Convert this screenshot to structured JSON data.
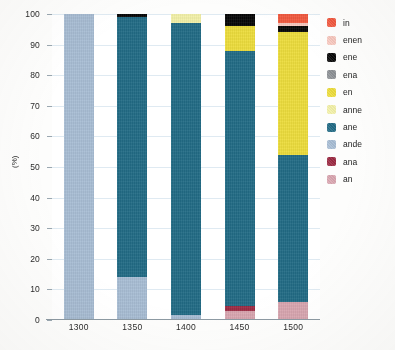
{
  "chart_data": {
    "type": "bar",
    "stacked": true,
    "title": "",
    "xlabel": "",
    "ylabel": "(%)",
    "ylim": [
      0,
      100
    ],
    "yticks": [
      0,
      10,
      20,
      30,
      40,
      50,
      60,
      70,
      80,
      90,
      100
    ],
    "grid": true,
    "legend_position": "right",
    "categories": [
      "1300",
      "1350",
      "1400",
      "1450",
      "1500"
    ],
    "series": [
      {
        "name": "an",
        "color": "#d9a6b0",
        "values": [
          0,
          0,
          0,
          3.0,
          6.0
        ]
      },
      {
        "name": "ana",
        "color": "#9c2b43",
        "values": [
          0,
          0,
          0,
          1.5,
          0
        ]
      },
      {
        "name": "ande",
        "color": "#a8bdd4",
        "values": [
          100,
          14.0,
          1.5,
          0,
          0
        ]
      },
      {
        "name": "ane",
        "color": "#226b85",
        "values": [
          0,
          85.0,
          95.5,
          83.5,
          48.0
        ]
      },
      {
        "name": "anne",
        "color": "#f2f0a8",
        "values": [
          0,
          0,
          3.0,
          0,
          0
        ]
      },
      {
        "name": "en",
        "color": "#ecdc3c",
        "values": [
          0,
          0,
          0,
          8.0,
          40.0
        ]
      },
      {
        "name": "ena",
        "color": "#8e9296",
        "values": [
          0,
          0,
          0,
          0,
          0
        ]
      },
      {
        "name": "ene",
        "color": "#080808",
        "values": [
          0,
          1.0,
          0,
          4.0,
          2.0
        ]
      },
      {
        "name": "enen",
        "color": "#f8c9c0",
        "values": [
          0,
          0,
          0,
          0,
          1.0
        ]
      },
      {
        "name": "in",
        "color": "#f2593f",
        "values": [
          0,
          0,
          0,
          0,
          3.0
        ]
      }
    ]
  },
  "legend": {
    "items": [
      {
        "label": "in",
        "color": "#f2593f"
      },
      {
        "label": "enen",
        "color": "#f8c9c0"
      },
      {
        "label": "ene",
        "color": "#080808"
      },
      {
        "label": "ena",
        "color": "#8e9296"
      },
      {
        "label": "en",
        "color": "#ecdc3c"
      },
      {
        "label": "anne",
        "color": "#f2f0a8"
      },
      {
        "label": "ane",
        "color": "#226b85"
      },
      {
        "label": "ande",
        "color": "#a8bdd4"
      },
      {
        "label": "ana",
        "color": "#9c2b43"
      },
      {
        "label": "an",
        "color": "#d9a6b0"
      }
    ]
  },
  "axes": {
    "y_title": "(%)",
    "y_tick_labels": [
      "0",
      "10",
      "20",
      "30",
      "40",
      "50",
      "60",
      "70",
      "80",
      "90",
      "100"
    ],
    "x_tick_labels": [
      "1300",
      "1350",
      "1400",
      "1450",
      "1500"
    ]
  }
}
